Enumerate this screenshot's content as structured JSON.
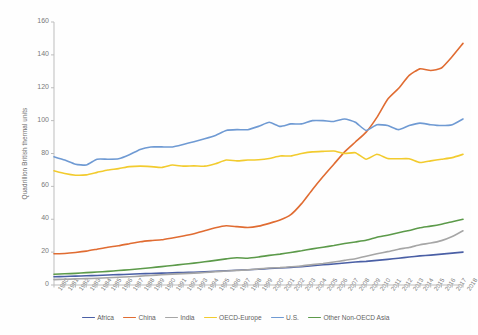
{
  "chart_data": {
    "type": "line",
    "title": "",
    "xlabel": "",
    "ylabel": "Quadrillion British thermal units",
    "ylim": [
      0,
      160
    ],
    "ytick_labels": [
      "0",
      "20",
      "40",
      "60",
      "80",
      "100",
      "120",
      "140",
      "160"
    ],
    "yticks": [
      0,
      20,
      40,
      60,
      80,
      100,
      120,
      140,
      160
    ],
    "grid": false,
    "legend_position": "bottom",
    "x": [
      1980,
      1981,
      1982,
      1983,
      1984,
      1985,
      1986,
      1987,
      1988,
      1989,
      1990,
      1991,
      1992,
      1993,
      1994,
      1995,
      1996,
      1997,
      1998,
      1999,
      2000,
      2001,
      2002,
      2003,
      2004,
      2005,
      2006,
      2007,
      2008,
      2009,
      2010,
      2011,
      2012,
      2013,
      2014,
      2015,
      2016,
      2017,
      2018
    ],
    "categories": [
      "1980",
      "1981",
      "1982",
      "1983",
      "1984",
      "1985",
      "1986",
      "1987",
      "1988",
      "1989",
      "1990",
      "1991",
      "1992",
      "1993",
      "1994",
      "1995",
      "1996",
      "1997",
      "1998",
      "1999",
      "2000",
      "2001",
      "2002",
      "2003",
      "2004",
      "2005",
      "2006",
      "2007",
      "2008",
      "2009",
      "2010",
      "2011",
      "2012",
      "2013",
      "2014",
      "2015",
      "2016",
      "2017",
      "2018"
    ],
    "series": [
      {
        "name": "Africa",
        "color": "#4a5fa5",
        "values": [
          5.0,
          5.2,
          5.4,
          5.6,
          5.8,
          6.1,
          6.3,
          6.5,
          6.8,
          7.0,
          7.2,
          7.4,
          7.6,
          7.8,
          8.1,
          8.4,
          8.7,
          9.0,
          9.3,
          9.6,
          10.0,
          10.3,
          10.7,
          11.2,
          11.8,
          12.3,
          12.8,
          13.4,
          14.0,
          14.4,
          15.0,
          15.6,
          16.3,
          17.0,
          17.7,
          18.2,
          18.8,
          19.4,
          20.0
        ]
      },
      {
        "name": "China",
        "color": "#e06c32",
        "values": [
          19.0,
          19.2,
          19.8,
          20.6,
          21.8,
          23.0,
          23.9,
          25.1,
          26.3,
          27.0,
          27.5,
          28.6,
          29.8,
          31.2,
          33.0,
          34.8,
          36.0,
          35.5,
          35.0,
          35.8,
          37.5,
          39.5,
          42.8,
          49.5,
          58.0,
          66.0,
          73.5,
          81.0,
          87.0,
          93.0,
          102.0,
          113.0,
          119.5,
          127.5,
          131.5,
          130.5,
          132.0,
          139.0,
          147.0
        ]
      },
      {
        "name": "India",
        "color": "#a6a6a6",
        "values": [
          3.3,
          3.5,
          3.7,
          3.9,
          4.1,
          4.4,
          4.7,
          5.0,
          5.4,
          5.8,
          6.2,
          6.6,
          6.9,
          7.2,
          7.6,
          8.1,
          8.5,
          8.9,
          9.2,
          9.8,
          10.3,
          10.6,
          11.1,
          11.6,
          12.4,
          13.1,
          14.0,
          15.0,
          16.0,
          17.5,
          19.0,
          20.3,
          21.8,
          22.8,
          24.5,
          25.5,
          27.0,
          29.5,
          33.0
        ]
      },
      {
        "name": "OECD-Europe",
        "color": "#f2cb2e",
        "values": [
          69.5,
          67.8,
          66.8,
          67.0,
          68.5,
          70.0,
          70.8,
          72.0,
          72.3,
          72.0,
          71.5,
          73.0,
          72.3,
          72.5,
          72.3,
          73.8,
          76.0,
          75.5,
          76.0,
          76.2,
          77.0,
          78.5,
          78.5,
          80.0,
          81.0,
          81.3,
          81.5,
          80.0,
          80.5,
          76.5,
          79.5,
          77.0,
          76.8,
          76.8,
          74.5,
          75.5,
          76.5,
          77.5,
          79.5
        ]
      },
      {
        "name": "U.S.",
        "color": "#6f9ad3",
        "values": [
          78.0,
          76.0,
          73.5,
          73.0,
          76.5,
          76.5,
          76.8,
          79.2,
          82.5,
          84.0,
          84.0,
          84.0,
          85.5,
          87.2,
          89.0,
          91.0,
          94.0,
          94.5,
          94.5,
          96.5,
          99.0,
          96.5,
          98.0,
          98.0,
          100.0,
          100.0,
          99.5,
          101.0,
          99.0,
          94.0,
          97.5,
          97.0,
          94.5,
          97.0,
          98.5,
          97.5,
          97.0,
          97.5,
          101.0
        ]
      },
      {
        "name": "Other Non-OECD Asia",
        "color": "#5c9a4a",
        "values": [
          6.5,
          6.8,
          7.1,
          7.5,
          7.9,
          8.3,
          8.8,
          9.3,
          9.9,
          10.5,
          11.2,
          11.9,
          12.6,
          13.3,
          14.1,
          15.0,
          15.9,
          16.6,
          16.3,
          17.0,
          18.0,
          18.8,
          19.8,
          20.8,
          22.0,
          23.0,
          24.0,
          25.2,
          26.2,
          27.2,
          29.0,
          30.3,
          31.8,
          33.2,
          34.8,
          35.8,
          37.0,
          38.5,
          40.0
        ]
      }
    ]
  }
}
